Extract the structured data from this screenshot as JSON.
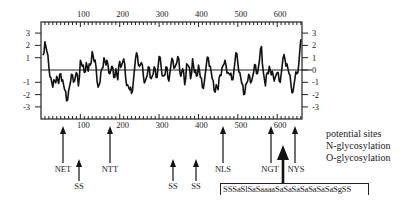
{
  "chart_data": {
    "type": "line",
    "title": "",
    "xlabel": "",
    "ylabel": "",
    "xlim": [
      0,
      663
    ],
    "ylim": [
      -3.3,
      3.3
    ],
    "grid": false,
    "zero_line": true,
    "x_ticks_top": [
      100,
      200,
      300,
      400,
      500,
      600
    ],
    "x_ticks_bottom": [
      100,
      200,
      300,
      400,
      500,
      600
    ],
    "y_ticks_left": [
      3,
      2,
      1,
      -1,
      -2,
      -3
    ],
    "y_ticks_right": [
      3,
      2,
      1,
      0,
      -1,
      -2,
      -3
    ],
    "series": [
      {
        "name": "hydropathy profile",
        "x": [
          5,
          10,
          15,
          20,
          25,
          30,
          35,
          40,
          45,
          50,
          55,
          60,
          65,
          70,
          75,
          80,
          85,
          90,
          95,
          100,
          105,
          110,
          115,
          120,
          125,
          130,
          135,
          140,
          145,
          150,
          155,
          160,
          165,
          170,
          175,
          180,
          185,
          190,
          195,
          200,
          205,
          210,
          215,
          220,
          225,
          230,
          235,
          240,
          245,
          250,
          255,
          260,
          265,
          270,
          275,
          280,
          285,
          290,
          295,
          300,
          305,
          310,
          315,
          320,
          325,
          330,
          335,
          340,
          345,
          350,
          355,
          360,
          365,
          370,
          375,
          380,
          385,
          390,
          395,
          400,
          405,
          410,
          415,
          420,
          425,
          430,
          435,
          440,
          445,
          450,
          455,
          460,
          465,
          470,
          475,
          480,
          485,
          490,
          495,
          500,
          505,
          510,
          515,
          520,
          525,
          530,
          535,
          540,
          545,
          550,
          555,
          560,
          565,
          570,
          575,
          580,
          585,
          590,
          595,
          600,
          605,
          610,
          615,
          620,
          625,
          630,
          635,
          640,
          645,
          650,
          655,
          660
        ],
        "values": [
          1.2,
          2.3,
          1.5,
          0.2,
          -0.6,
          -1.4,
          -0.9,
          -0.5,
          -1.1,
          -0.3,
          -0.8,
          -1.6,
          -2.5,
          -1.7,
          -1.0,
          -0.4,
          -0.9,
          -0.2,
          -1.3,
          0.8,
          0.3,
          -0.2,
          0.6,
          -0.1,
          0.4,
          1.5,
          0.7,
          0.2,
          -1.4,
          -1.0,
          0.1,
          1.0,
          0.4,
          0.5,
          -0.3,
          0.3,
          -0.6,
          0.1,
          -0.8,
          0.7,
          0.4,
          0.9,
          -0.6,
          -1.2,
          -1.6,
          -1.9,
          -0.8,
          0.9,
          1.2,
          0.3,
          0.6,
          -0.5,
          -0.9,
          -0.4,
          0.2,
          -0.7,
          -0.3,
          0.1,
          -0.6,
          1.1,
          0.3,
          -0.5,
          -0.4,
          0.2,
          -0.9,
          0.4,
          0.8,
          0.2,
          0.6,
          0.9,
          -0.5,
          0.1,
          -1.2,
          0.5,
          0.3,
          -0.7,
          0.9,
          -0.2,
          -0.5,
          0.4,
          -0.6,
          -1.4,
          -0.9,
          0.4,
          1.0,
          0.3,
          -0.7,
          -1.7,
          -1.2,
          -1.6,
          -0.4,
          0.2,
          0.5,
          0.4,
          -0.2,
          -0.4,
          -0.8,
          -0.1,
          1.4,
          0.6,
          -0.2,
          -1.1,
          -2.0,
          -1.2,
          -0.9,
          -0.5,
          -0.9,
          -0.2,
          0.4,
          -0.3,
          0.8,
          1.9,
          -0.2,
          -1.3,
          -0.2,
          0.3,
          -0.4,
          -0.5,
          -0.6,
          -0.2,
          -0.9,
          -0.4,
          1.0,
          0.8,
          0.5,
          -0.3,
          -1.2,
          -1.8,
          -0.7,
          -0.3,
          0.6,
          2.5
        ]
      }
    ],
    "annotations": [
      {
        "label": "NET",
        "x": 58,
        "kind": "N-glycosylation"
      },
      {
        "label": "SS",
        "x": 98,
        "kind": "O-glycosylation"
      },
      {
        "label": "NTT",
        "x": 178,
        "kind": "N-glycosylation"
      },
      {
        "label": "SS",
        "x": 337,
        "kind": "O-glycosylation"
      },
      {
        "label": "SS",
        "x": 395,
        "kind": "O-glycosylation"
      },
      {
        "label": "NLS",
        "x": 463,
        "kind": "N-glycosylation"
      },
      {
        "label": "NGT",
        "x": 587,
        "kind": "N-glycosylation"
      },
      {
        "label": "NYS",
        "x": 645,
        "kind": "N-glycosylation"
      },
      {
        "label": "SSSaSlSaSaaaaSaSaSaSaSaSaSaSgSS",
        "x": 620,
        "kind": "O-glycosylation cluster"
      }
    ],
    "legend": [
      "potential sites",
      "N-glycosylation",
      "O-glycosylation"
    ],
    "legend_position": "right"
  },
  "legend": {
    "title": "potential sites",
    "n_glyco": "N-glycosylation",
    "o_glyco": "O-glycosylation"
  },
  "sites": {
    "net": "NET",
    "ss1": "SS",
    "ntt": "NTT",
    "ss2": "SS",
    "ss3": "SS",
    "nls": "NLS",
    "ngt": "NGT",
    "nys": "NYS"
  },
  "sequence": "SSSaSlSaSaaaaSaSaSaSaSaSaSaSgSS"
}
